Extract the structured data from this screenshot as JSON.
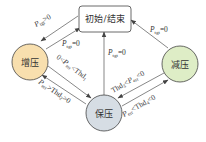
{
  "nodes": {
    "start_end": {
      "label": "初始/结束",
      "fill": "#ffffff"
    },
    "increase": {
      "label": "增压",
      "fill": "#f8dfae"
    },
    "decrease": {
      "label": "减压",
      "fill": "#deedc6"
    },
    "hold": {
      "label": "保压",
      "fill": "#d6dde4"
    }
  },
  "edges": [
    {
      "from": "start_end",
      "to": "increase",
      "label": "P_tgt>0"
    },
    {
      "from": "increase",
      "to": "start_end",
      "label": "P_tgt=0"
    },
    {
      "from": "hold",
      "to": "start_end",
      "label": "P_tgt=0"
    },
    {
      "from": "decrease",
      "to": "start_end",
      "label": "P_tgt=0"
    },
    {
      "from": "increase",
      "to": "hold",
      "label": "0<P_err<Thd_1"
    },
    {
      "from": "hold",
      "to": "increase",
      "label": "P_err>Thd_2>0"
    },
    {
      "from": "decrease",
      "to": "hold",
      "label": "Thd_3<P_err<0"
    },
    {
      "from": "hold",
      "to": "decrease",
      "label": "P_err<Thd_4<0"
    }
  ],
  "labels": {
    "e1_main": "P",
    "e1_sub": "tgt",
    "e1_rest": ">0",
    "e2_main": "P",
    "e2_sub": "tgt",
    "e2_rest": "=0",
    "e3_main": "P",
    "e3_sub": "tgt",
    "e3_rest": "=0",
    "e4_main": "P",
    "e4_sub": "tgt",
    "e4_rest": "=0",
    "e5_pre": "0<",
    "e5_main": "P",
    "e5_sub": "err",
    "e5_rest": "<Thd",
    "e5_sub2": "1",
    "e6_main": "P",
    "e6_sub": "err",
    "e6_rest": ">Thd",
    "e6_sub2": "2",
    "e6_tail": ">0",
    "e7_pre": "Thd",
    "e7_presub": "3",
    "e7_mid": "<",
    "e7_main": "P",
    "e7_sub": "err",
    "e7_rest": "<0",
    "e8_main": "P",
    "e8_sub": "err",
    "e8_rest": "<Thd",
    "e8_sub2": "4",
    "e8_tail": "<0"
  }
}
